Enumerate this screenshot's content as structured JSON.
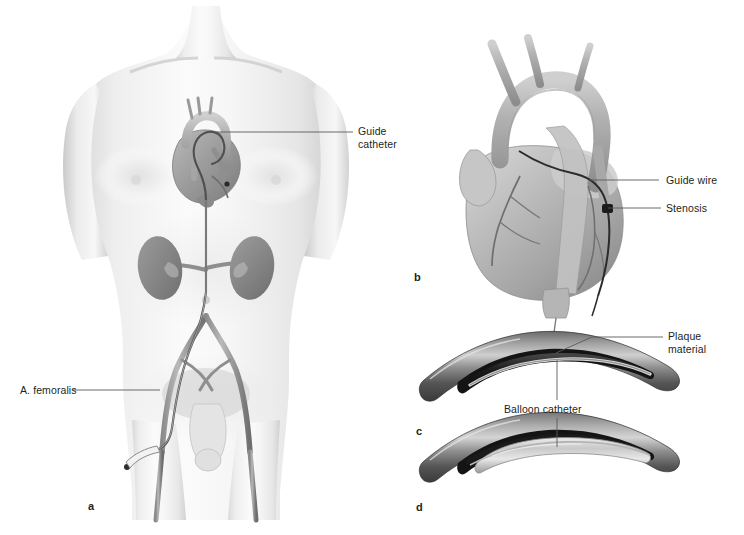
{
  "figure": {
    "background_color": "#ffffff",
    "text_color": "#231f20",
    "line_color": "#5a5a5a"
  },
  "panels": [
    {
      "id": "a",
      "letter": "a",
      "caption": "Whole-body view: guide catheter advanced from femoral artery to the heart"
    },
    {
      "id": "b",
      "letter": "b",
      "caption": "Heart with aortic arch, guide wire crossing a coronary stenosis"
    },
    {
      "id": "c",
      "letter": "c",
      "caption": "Vessel cross-section with plaque material and deflated balloon catheter"
    },
    {
      "id": "d",
      "letter": "d",
      "caption": "Vessel cross-section with inflated balloon compressing the plaque"
    }
  ],
  "labels": {
    "guide_catheter": "Guide\ncatheter",
    "a_femoralis": "A. femoralis",
    "guide_wire": "Guide wire",
    "stenosis": "Stenosis",
    "plaque_material": "Plaque\nmaterial",
    "balloon_catheter": "Balloon catheter"
  },
  "anatomy": {
    "panel_a": [
      "torso",
      "neck",
      "clavicles",
      "pectorals",
      "kidneys",
      "aorta",
      "renal-arteries",
      "iliac-arteries",
      "femoral-arteries",
      "heart",
      "catheter"
    ],
    "panel_b": [
      "aortic-arch",
      "brachiocephalic-trunk",
      "left-common-carotid",
      "left-subclavian",
      "ascending-aorta",
      "pulmonary-trunk",
      "right-ventricle",
      "left-ventricle",
      "coronary-arteries",
      "guide-wire",
      "stenosis-site"
    ],
    "panel_c": [
      "artery-wall",
      "plaque",
      "lumen",
      "balloon-catheter-deflated"
    ],
    "panel_d": [
      "artery-wall",
      "plaque-compressed",
      "lumen",
      "balloon-catheter-inflated"
    ]
  }
}
